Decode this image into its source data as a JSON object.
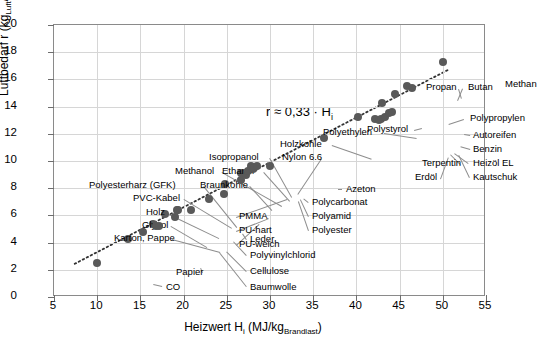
{
  "chart_data": {
    "type": "scatter",
    "title": "",
    "xlabel": "Heizwert Hi (MJ/kgBrandlast)",
    "ylabel": "Luftbedarf r (kgLuft/kgBrandlast)",
    "xlim": [
      5,
      55
    ],
    "ylim": [
      0,
      20
    ],
    "xticks": [
      5,
      10,
      15,
      20,
      25,
      30,
      35,
      40,
      45,
      50,
      55
    ],
    "yticks": [
      0,
      2,
      4,
      6,
      8,
      10,
      12,
      14,
      16,
      18,
      20
    ],
    "grid": true,
    "legend": "none",
    "annotation": "r ≈ 0,33 · Hi",
    "trendline": {
      "slope": 0.33,
      "intercept": 0,
      "style": "dotted",
      "color": "#333333"
    },
    "marker": {
      "shape": "circle",
      "color": "#595959",
      "size": 8
    },
    "points": [
      {
        "label": "CO",
        "x": 10.0,
        "y": 2.5,
        "lx": 112,
        "ly": 262,
        "anchor": "left"
      },
      {
        "label": "Papier",
        "x": 13.6,
        "y": 4.3,
        "lx": 122,
        "ly": 247,
        "anchor": "left"
      },
      {
        "label": "Karton, Pappe",
        "x": 15.3,
        "y": 4.8,
        "lx": 60,
        "ly": 213,
        "anchor": "left"
      },
      {
        "label": "Glycol",
        "x": 16.5,
        "y": 5.4,
        "lx": 88,
        "ly": 200,
        "anchor": "left"
      },
      {
        "label": "Baumwolle",
        "x": 16.8,
        "y": 5.2,
        "lx": 196,
        "ly": 262,
        "anchor": "left"
      },
      {
        "label": "Cellulose",
        "x": 17.2,
        "y": 5.2,
        "lx": 196,
        "ly": 246,
        "anchor": "left"
      },
      {
        "label": "Holz",
        "x": 17.8,
        "y": 6.1,
        "lx": 92,
        "ly": 187,
        "anchor": "left"
      },
      {
        "label": "Polyvinylchlorid",
        "x": 19.0,
        "y": 5.9,
        "lx": 196,
        "ly": 230,
        "anchor": "left"
      },
      {
        "label": "PVC-Kabel",
        "x": 19.2,
        "y": 6.4,
        "lx": 79,
        "ly": 173,
        "anchor": "left"
      },
      {
        "label": "Polyesterharz (GFK)",
        "x": 19.4,
        "y": 6.4,
        "lx": 35,
        "ly": 160,
        "anchor": "left"
      },
      {
        "label": "Leder",
        "x": 20.8,
        "y": 6.4,
        "lx": 196,
        "ly": 214,
        "anchor": "left"
      },
      {
        "label": "PU-weich",
        "x": 22.9,
        "y": 7.2,
        "lx": 185,
        "ly": 219,
        "anchor": "left"
      },
      {
        "label": "PU-hart",
        "x": 24.7,
        "y": 7.6,
        "lx": 185,
        "ly": 205,
        "anchor": "left"
      },
      {
        "label": "Braunkohle",
        "x": 24.8,
        "y": 8.3,
        "lx": 146,
        "ly": 160,
        "anchor": "left"
      },
      {
        "label": "PMMA",
        "x": 26.6,
        "y": 9.1,
        "lx": 185,
        "ly": 191,
        "anchor": "left"
      },
      {
        "label": "Methanol",
        "x": 26.7,
        "y": 8.6,
        "lx": 121,
        "ly": 146,
        "anchor": "left"
      },
      {
        "label": "Ethanol",
        "x": 27.2,
        "y": 9.0,
        "lx": 168,
        "ly": 146,
        "anchor": "left"
      },
      {
        "label": "Isopropanol",
        "x": 27.4,
        "y": 9.3,
        "lx": 155,
        "ly": 132,
        "anchor": "left"
      },
      {
        "label": "Nylon 6.6",
        "x": 27.8,
        "y": 9.6,
        "lx": 228,
        "ly": 132,
        "anchor": "left"
      },
      {
        "label": "Polyester",
        "x": 28.0,
        "y": 9.4,
        "lx": 258,
        "ly": 205,
        "anchor": "left"
      },
      {
        "label": "Polyamid",
        "x": 28.2,
        "y": 9.5,
        "lx": 258,
        "ly": 191,
        "anchor": "left"
      },
      {
        "label": "Polycarbonat",
        "x": 28.5,
        "y": 9.6,
        "lx": 258,
        "ly": 177,
        "anchor": "left"
      },
      {
        "label": "Azeton",
        "x": 30.0,
        "y": 9.6,
        "lx": 292,
        "ly": 164,
        "anchor": "left"
      },
      {
        "label": "Holzkohle",
        "x": 36.3,
        "y": 11.7,
        "lx": 226,
        "ly": 119,
        "anchor": "left"
      },
      {
        "label": "Polystyrol",
        "x": 40.2,
        "y": 13.2,
        "lx": 313,
        "ly": 104,
        "anchor": "left"
      },
      {
        "label": "Terpentin",
        "x": 42.2,
        "y": 13.1,
        "lx": 368,
        "ly": 138,
        "anchor": "left"
      },
      {
        "label": "Erdöl",
        "x": 42.6,
        "y": 13.0,
        "lx": 361,
        "ly": 152,
        "anchor": "left"
      },
      {
        "label": "Polyethylen",
        "x": 43.0,
        "y": 14.3,
        "lx": 269,
        "ly": 107,
        "anchor": "left"
      },
      {
        "label": "Heizöl EL",
        "x": 42.9,
        "y": 13.1,
        "lx": 419,
        "ly": 138,
        "anchor": "left"
      },
      {
        "label": "Kautschuk",
        "x": 43.3,
        "y": 13.2,
        "lx": 419,
        "ly": 152,
        "anchor": "left"
      },
      {
        "label": "Benzin",
        "x": 43.8,
        "y": 13.5,
        "lx": 419,
        "ly": 124,
        "anchor": "left"
      },
      {
        "label": "Autoreifen",
        "x": 44.1,
        "y": 13.6,
        "lx": 419,
        "ly": 110,
        "anchor": "left"
      },
      {
        "label": "Propan",
        "x": 45.9,
        "y": 15.5,
        "lx": 372,
        "ly": 62,
        "anchor": "left"
      },
      {
        "label": "Butan",
        "x": 46.4,
        "y": 15.4,
        "lx": 414,
        "ly": 62,
        "anchor": "left"
      },
      {
        "label": "Polypropylen",
        "x": 44.5,
        "y": 14.9,
        "lx": 416,
        "ly": 93,
        "anchor": "left"
      },
      {
        "label": "Methan",
        "x": 50.0,
        "y": 17.3,
        "lx": 451,
        "ly": 59,
        "anchor": "left"
      }
    ],
    "leader_lines": [
      {
        "from": [
          108,
          262
        ],
        "to": [
          99,
          260
        ]
      },
      {
        "from": [
          148,
          248
        ],
        "to": [
          146,
          243
        ]
      },
      {
        "from": [
          118,
          214
        ],
        "to": [
          166,
          227
        ]
      },
      {
        "from": [
          117,
          201
        ],
        "to": [
          153,
          222
        ]
      },
      {
        "from": [
          192,
          262
        ],
        "to": [
          165,
          228
        ]
      },
      {
        "from": [
          192,
          247
        ],
        "to": [
          172,
          227
        ]
      },
      {
        "from": [
          113,
          188
        ],
        "to": [
          165,
          213
        ]
      },
      {
        "from": [
          192,
          231
        ],
        "to": [
          179,
          217
        ]
      },
      {
        "from": [
          130,
          174
        ],
        "to": [
          178,
          203
        ]
      },
      {
        "from": [
          150,
          161
        ],
        "to": [
          183,
          202
        ]
      },
      {
        "from": [
          192,
          215
        ],
        "to": [
          188,
          209
        ]
      },
      {
        "from": [
          182,
          220
        ],
        "to": [
          205,
          199
        ]
      },
      {
        "from": [
          182,
          206
        ],
        "to": [
          215,
          193
        ]
      },
      {
        "from": [
          196,
          161
        ],
        "to": [
          218,
          185
        ]
      },
      {
        "from": [
          182,
          192
        ],
        "to": [
          233,
          174
        ]
      },
      {
        "from": [
          168,
          147
        ],
        "to": [
          228,
          181
        ]
      },
      {
        "from": [
          210,
          147
        ],
        "to": [
          236,
          176
        ]
      },
      {
        "from": [
          216,
          133
        ],
        "to": [
          238,
          172
        ]
      },
      {
        "from": [
          268,
          134
        ],
        "to": [
          244,
          170
        ]
      },
      {
        "from": [
          254,
          206
        ],
        "to": [
          244,
          177
        ]
      },
      {
        "from": [
          254,
          192
        ],
        "to": [
          246,
          175
        ]
      },
      {
        "from": [
          254,
          178
        ],
        "to": [
          249,
          174
        ]
      },
      {
        "from": [
          288,
          165
        ],
        "to": [
          284,
          165
        ]
      },
      {
        "from": [
          278,
          120
        ],
        "to": [
          318,
          134
        ]
      },
      {
        "from": [
          360,
          105
        ],
        "to": [
          368,
          103
        ]
      },
      {
        "from": [
          414,
          139
        ],
        "to": [
          400,
          129
        ]
      },
      {
        "from": [
          415,
          153
        ],
        "to": [
          404,
          130
        ]
      },
      {
        "from": [
          416,
          125
        ],
        "to": [
          406,
          122
        ]
      },
      {
        "from": [
          416,
          111
        ],
        "to": [
          410,
          110
        ]
      },
      {
        "from": [
          406,
          140
        ],
        "to": [
          396,
          130
        ]
      },
      {
        "from": [
          386,
          154
        ],
        "to": [
          394,
          132
        ]
      },
      {
        "from": [
          330,
          108
        ],
        "to": [
          363,
          113
        ]
      },
      {
        "from": [
          410,
          95
        ],
        "to": [
          395,
          100
        ]
      },
      {
        "from": [
          405,
          64
        ],
        "to": [
          408,
          74
        ]
      },
      {
        "from": [
          409,
          64
        ],
        "to": [
          404,
          76
        ]
      }
    ]
  }
}
